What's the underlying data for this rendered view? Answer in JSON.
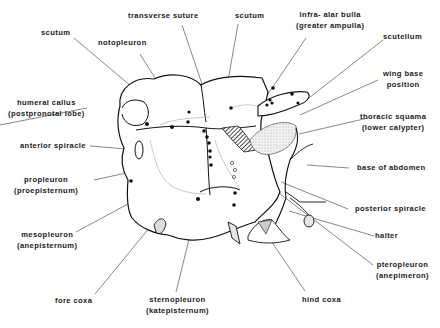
{
  "diagram": {
    "labels": [
      {
        "id": "transverse-suture",
        "lines": [
          "transverse suture"
        ]
      },
      {
        "id": "scutum-left",
        "lines": [
          "scutum"
        ]
      },
      {
        "id": "notopleuron",
        "lines": [
          "notopleuron"
        ]
      },
      {
        "id": "scutum-right",
        "lines": [
          "scutum"
        ]
      },
      {
        "id": "infra-alar-bulla",
        "lines": [
          "infra- alar bulla",
          "(greater ampulla)"
        ]
      },
      {
        "id": "scutellum",
        "lines": [
          "scutellum"
        ]
      },
      {
        "id": "wing-base-position",
        "lines": [
          "wing base",
          "position"
        ]
      },
      {
        "id": "humeral-callus",
        "lines": [
          "humeral callus",
          "(postpronotal lobe)"
        ]
      },
      {
        "id": "anterior-spiracle",
        "lines": [
          "anterior spiracle"
        ]
      },
      {
        "id": "thoracic-squama",
        "lines": [
          "thoracic squama",
          "(lower calypter)"
        ]
      },
      {
        "id": "base-of-abdomen",
        "lines": [
          "base of abdomen"
        ]
      },
      {
        "id": "propleuron",
        "lines": [
          "propleuron",
          "(proepisternum)"
        ]
      },
      {
        "id": "posterior-spiracle",
        "lines": [
          "posterior spiracle"
        ]
      },
      {
        "id": "halter",
        "lines": [
          "halter"
        ]
      },
      {
        "id": "mesopleuron",
        "lines": [
          "mesopleuron",
          "(anepisternum)"
        ]
      },
      {
        "id": "pteropleuron",
        "lines": [
          "pteropleuron",
          "(anepimeron)"
        ]
      },
      {
        "id": "fore-coxa",
        "lines": [
          "fore coxa"
        ]
      },
      {
        "id": "sternopleuron",
        "lines": [
          "sternopleuron",
          "(katepisternum)"
        ]
      },
      {
        "id": "hind-coxa",
        "lines": [
          "hind coxa"
        ]
      }
    ]
  }
}
